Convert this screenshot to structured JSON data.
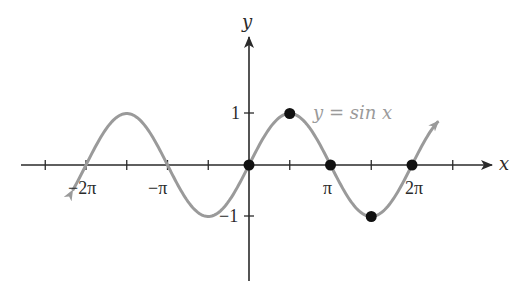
{
  "chart_data": {
    "type": "line",
    "title": "",
    "function": "y = sin x",
    "xlabel": "x",
    "ylabel": "y",
    "xlim": [
      -7.8,
      7.5
    ],
    "ylim": [
      -1.6,
      2.5
    ],
    "grid": false,
    "legend": null,
    "x_ticks": [
      {
        "value": -6.2832,
        "label": "−2π"
      },
      {
        "value": -4.7124,
        "label": ""
      },
      {
        "value": -3.1416,
        "label": "−π"
      },
      {
        "value": -1.5708,
        "label": ""
      },
      {
        "value": 1.5708,
        "label": ""
      },
      {
        "value": 3.1416,
        "label": "π"
      },
      {
        "value": 4.7124,
        "label": ""
      },
      {
        "value": 6.2832,
        "label": "2π"
      },
      {
        "value": 7.854,
        "label": ""
      },
      {
        "value": -7.854,
        "label": ""
      }
    ],
    "y_ticks": [
      {
        "value": 1,
        "label": "1"
      },
      {
        "value": -1,
        "label": "−1"
      }
    ],
    "series": [
      {
        "name": "y = sin x",
        "color": "#9a9a9a",
        "x_range": [
          -6.8,
          7.3
        ],
        "arrows_both_ends": true
      }
    ],
    "highlighted_points": [
      {
        "x": 0,
        "y": 0,
        "label": "(0, 0)"
      },
      {
        "x": 1.5708,
        "y": 1,
        "label": "(π/2, 1)"
      },
      {
        "x": 3.1416,
        "y": 0,
        "label": "(π, 0)"
      },
      {
        "x": 4.7124,
        "y": -1,
        "label": "(3π/2, −1)"
      },
      {
        "x": 6.2832,
        "y": 0,
        "label": "(2π, 0)"
      }
    ],
    "annotations": [
      {
        "text": "y = sin x",
        "near": {
          "x": 2.0,
          "y": 1.0
        },
        "color": "#9a9a9a"
      }
    ]
  },
  "labels": {
    "x_axis": "x",
    "y_axis": "y",
    "curve": "y = sin x",
    "tick_neg2pi": "−2π",
    "tick_negpi": "−π",
    "tick_pi": "π",
    "tick_2pi": "2π",
    "tick_y1": "1",
    "tick_yneg1": "−1"
  },
  "colors": {
    "axis": "#2a2a2a",
    "curve": "#9a9a9a",
    "points": "#111111",
    "background": "#ffffff"
  }
}
